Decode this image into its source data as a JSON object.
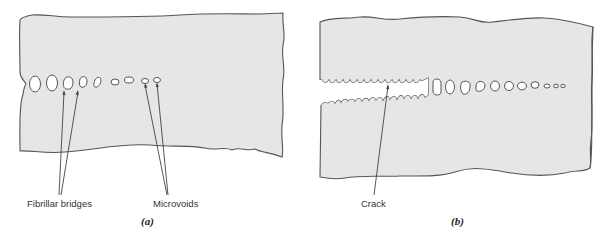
{
  "figure": {
    "panels": [
      {
        "id": "a",
        "caption": "(a)",
        "labels": {
          "fibrillar_bridges": "Fibrillar bridges",
          "microvoids": "Microvoids"
        }
      },
      {
        "id": "b",
        "caption": "(b)",
        "labels": {
          "crack": "Crack"
        }
      }
    ],
    "colors": {
      "material_fill": "#e6e6e6",
      "outline": "#555555",
      "void_fill": "#ffffff",
      "background": "#ffffff"
    }
  }
}
